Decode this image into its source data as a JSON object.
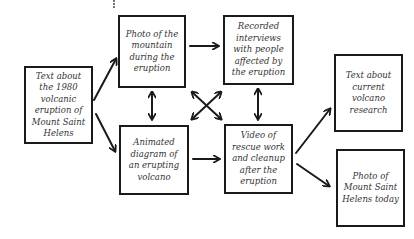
{
  "diagram": {
    "type": "flowchart",
    "nodes": [
      {
        "id": "text-1980",
        "label": "Text about the 1980 volcanic eruption of Mount Saint Helens"
      },
      {
        "id": "photo-mountain",
        "label": "Photo of the mountain during the eruption"
      },
      {
        "id": "interviews",
        "label": "Recorded interviews with people affected by the eruption"
      },
      {
        "id": "animated-diagram",
        "label": "Animated diagram of an erupting volcano"
      },
      {
        "id": "video-rescue",
        "label": "Video of rescue work and cleanup after the eruption"
      },
      {
        "id": "text-research",
        "label": "Text about current volcano research"
      },
      {
        "id": "photo-today",
        "label": "Photo of Mount Saint Helens today"
      }
    ],
    "edges": [
      {
        "from": "text-1980",
        "to": "photo-mountain",
        "direction": "one-way"
      },
      {
        "from": "text-1980",
        "to": "animated-diagram",
        "direction": "one-way"
      },
      {
        "from": "photo-mountain",
        "to": "interviews",
        "direction": "one-way"
      },
      {
        "from": "photo-mountain",
        "to": "animated-diagram",
        "direction": "two-way"
      },
      {
        "from": "photo-mountain",
        "to": "video-rescue",
        "direction": "two-way"
      },
      {
        "from": "interviews",
        "to": "animated-diagram",
        "direction": "two-way"
      },
      {
        "from": "interviews",
        "to": "video-rescue",
        "direction": "two-way"
      },
      {
        "from": "animated-diagram",
        "to": "video-rescue",
        "direction": "one-way"
      },
      {
        "from": "video-rescue",
        "to": "text-research",
        "direction": "one-way"
      },
      {
        "from": "video-rescue",
        "to": "photo-today",
        "direction": "one-way"
      }
    ]
  },
  "colors": {
    "stroke": "#1a1a1a",
    "text": "#333333",
    "background": "#ffffff"
  }
}
